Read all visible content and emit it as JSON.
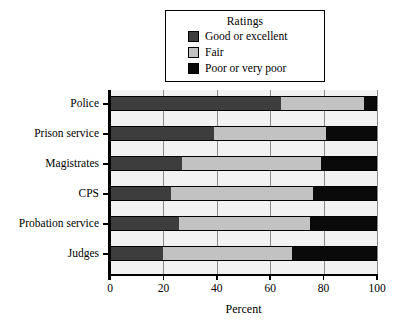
{
  "chart_data": {
    "type": "bar",
    "orientation": "horizontal",
    "stacked": true,
    "title": "",
    "xlabel": "Percent",
    "ylabel": "",
    "xlim": [
      0,
      100
    ],
    "xticks": [
      0,
      20,
      40,
      60,
      80,
      100
    ],
    "grid": true,
    "grid_axis": "x",
    "legend_title": "Ratings",
    "legend_position": "top-center",
    "categories": [
      "Police",
      "Prison service",
      "Magistrates",
      "CPS",
      "Probation service",
      "Judges"
    ],
    "series": [
      {
        "name": "Good or excellent",
        "color": "#3d3d3d",
        "values": [
          64,
          39,
          27,
          23,
          26,
          20
        ]
      },
      {
        "name": "Fair",
        "color": "#c2c2c2",
        "values": [
          31,
          42,
          52,
          53,
          49,
          48
        ]
      },
      {
        "name": "Poor or very poor",
        "color": "#0a0a0a",
        "values": [
          5,
          19,
          21,
          24,
          25,
          32
        ]
      }
    ]
  },
  "legend": {
    "title": "Ratings",
    "items": [
      {
        "label": "Good or excellent",
        "color": "#3d3d3d"
      },
      {
        "label": "Fair",
        "color": "#c2c2c2"
      },
      {
        "label": "Poor or very poor",
        "color": "#0a0a0a"
      }
    ]
  },
  "axes": {
    "x": {
      "title": "Percent",
      "tick_labels": [
        "0",
        "20",
        "40",
        "60",
        "80",
        "100"
      ]
    },
    "y": {
      "tick_labels": [
        "Police",
        "Prison service",
        "Magistrates",
        "CPS",
        "Probation service",
        "Judges"
      ]
    }
  },
  "style": {
    "plot_background": "#f2f2f2",
    "page_background": "#ffffff",
    "axis_color": "#000000",
    "gridline_color": "#8a8a8a"
  }
}
